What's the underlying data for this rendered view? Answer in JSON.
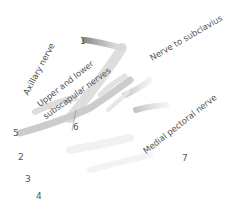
{
  "diagram": {
    "colors": {
      "background": "#ffffff",
      "text": "#555555",
      "nerve_dark": "#8a8a8a",
      "nerve_mid": "#b4b4b4",
      "nerve_light": "#d8d8d8",
      "nerve_faint": "#ececec"
    },
    "labels": [
      {
        "id": "axillary",
        "text": "Axillary nerve"
      },
      {
        "id": "subscapular_1",
        "text": "Upper and lower"
      },
      {
        "id": "subscapular_2",
        "text": "subscapular nerves"
      },
      {
        "id": "subclavius",
        "text": "Nerve  to subclavius"
      },
      {
        "id": "medial_pectoral",
        "text": "Medial pectoral nerve"
      }
    ],
    "numbers": [
      "1",
      "2",
      "3",
      "4",
      "5",
      "6",
      "7"
    ]
  }
}
